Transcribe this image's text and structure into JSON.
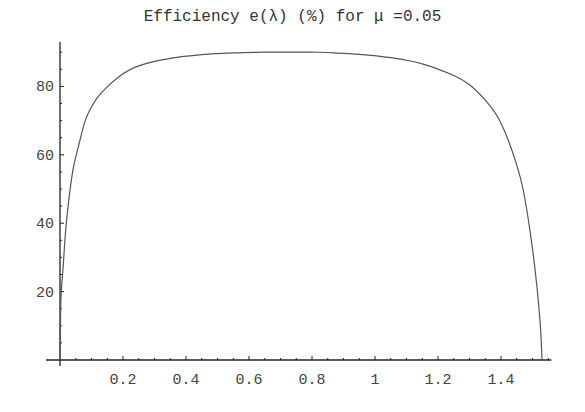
{
  "chart_data": {
    "type": "line",
    "title": "Efficiency e(λ) (%) for μ =0.05",
    "xlabel": "",
    "ylabel": "",
    "xlim": [
      0,
      1.56
    ],
    "ylim": [
      0,
      93
    ],
    "grid": false,
    "legend": null,
    "x_ticks": [
      "0.2",
      "0.4",
      "0.6",
      "0.8",
      "1",
      "1.2",
      "1.4"
    ],
    "y_ticks": [
      "20",
      "40",
      "60",
      "80"
    ],
    "series": [
      {
        "name": "e(λ)",
        "x": [
          0.0,
          0.003,
          0.01,
          0.02,
          0.04,
          0.06,
          0.08,
          0.1,
          0.13,
          0.19,
          0.25,
          0.35,
          0.45,
          0.55,
          0.65,
          0.7,
          0.75,
          0.8,
          0.85,
          0.95,
          1.05,
          1.15,
          1.25,
          1.3,
          1.35,
          1.39,
          1.42,
          1.45,
          1.47,
          1.49,
          1.51,
          1.525,
          1.53
        ],
        "values": [
          0,
          18,
          27,
          40,
          55,
          63,
          70,
          74,
          78,
          83,
          86,
          88.2,
          89.3,
          89.8,
          90,
          90,
          90,
          90,
          89.9,
          89.4,
          88.4,
          86.6,
          83.2,
          80.5,
          76,
          71,
          65,
          57,
          50,
          39,
          25,
          10,
          0
        ]
      }
    ],
    "annotations": []
  }
}
